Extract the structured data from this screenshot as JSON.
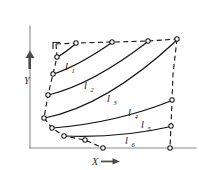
{
  "figure": {
    "title": "",
    "background_color": "#ffffff",
    "ink_color": "#141414",
    "axis_color": "#8a8a8a",
    "axes": {
      "x": {
        "label": "X",
        "arrow": "right-arrow-icon",
        "arrow_glyph": "→",
        "origin_px": [
          30,
          148
        ],
        "end_px": [
          196,
          148
        ]
      },
      "y": {
        "label": "Y",
        "arrow": "up-arrow-icon",
        "arrow_glyph": "↑",
        "origin_px": [
          30,
          148
        ],
        "end_px": [
          30,
          24
        ]
      }
    },
    "region": {
      "name": "bounded-quadrilateral-region",
      "style": "dashed",
      "corners_px": [
        [
          55,
          44
        ],
        [
          176,
          40
        ],
        [
          170,
          148
        ],
        [
          84,
          140
        ]
      ]
    },
    "curves": [
      {
        "id": "l1",
        "label": "l",
        "subscript": "1",
        "start_px": [
          57,
          57
        ],
        "end_px": [
          76,
          43
        ],
        "label_px": [
          68,
          66
        ]
      },
      {
        "id": "l2",
        "label": "l",
        "subscript": "2",
        "start_px": [
          53,
          74
        ],
        "end_px": [
          112,
          42
        ],
        "label_px": [
          87,
          85
        ]
      },
      {
        "id": "l3",
        "label": "l",
        "subscript": "3",
        "start_px": [
          48,
          95
        ],
        "end_px": [
          148,
          41
        ],
        "label_px": [
          110,
          98
        ]
      },
      {
        "id": "l4",
        "label": "l",
        "subscript": "4",
        "start_px": [
          44,
          118
        ],
        "end_px": [
          176,
          40
        ],
        "label_px": [
          131,
          112
        ]
      },
      {
        "id": "l5",
        "label": "l",
        "subscript": "5",
        "start_px": [
          52,
          128
        ],
        "end_px": [
          172,
          100
        ],
        "label_px": [
          144,
          124
        ]
      },
      {
        "id": "l6",
        "label": "l",
        "subscript": "6",
        "start_px": [
          64,
          136
        ],
        "end_px": [
          171,
          126
        ],
        "label_px": [
          128,
          140
        ]
      }
    ],
    "node_markers_px": [
      [
        57,
        57
      ],
      [
        53,
        74
      ],
      [
        48,
        95
      ],
      [
        44,
        118
      ],
      [
        52,
        128
      ],
      [
        64,
        136
      ],
      [
        76,
        43
      ],
      [
        112,
        42
      ],
      [
        148,
        41
      ],
      [
        176,
        40
      ],
      [
        172,
        100
      ],
      [
        171,
        126
      ],
      [
        85,
        140
      ],
      [
        103,
        148
      ],
      [
        170,
        148
      ]
    ]
  }
}
